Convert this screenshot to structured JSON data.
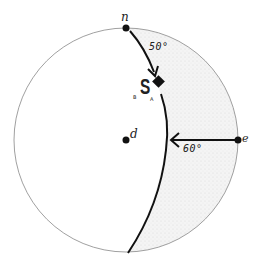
{
  "diagram": {
    "type": "stereonet-projection",
    "circle": {
      "cx": 126,
      "cy": 140,
      "r": 112
    },
    "points": {
      "n": {
        "label": "n",
        "x": 126,
        "y": 28
      },
      "d": {
        "label": "d",
        "x": 126,
        "y": 140
      },
      "e": {
        "label": "e",
        "x": 238,
        "y": 140
      }
    },
    "symbol": {
      "label": "S",
      "sub_left": "B",
      "sub_right": "A"
    },
    "angles": {
      "from_n": "50°",
      "from_e": "60°"
    },
    "colors": {
      "ink": "#111111",
      "circle": "#888888",
      "shade": "#eeeeee"
    }
  }
}
